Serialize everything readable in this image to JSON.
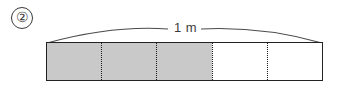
{
  "figure": {
    "item_number": "②",
    "measurement_label": "1 m"
  },
  "chart_data": {
    "type": "bar",
    "title": "",
    "subtitle": "",
    "xlabel": "",
    "ylabel": "",
    "annotations": [
      "1 m"
    ],
    "total_length_label": "1 m",
    "total_segments": 5,
    "shaded_segments": 3,
    "unshaded_segments": 2,
    "fraction_shaded": "3/5",
    "segments": [
      {
        "index": 1,
        "state": "shaded"
      },
      {
        "index": 2,
        "state": "shaded"
      },
      {
        "index": 3,
        "state": "shaded"
      },
      {
        "index": 4,
        "state": "unshaded"
      },
      {
        "index": 5,
        "state": "unshaded"
      }
    ],
    "colors": {
      "shaded_fill": "#c9c9c9",
      "unshaded_fill": "#ffffff",
      "outline": "#222222",
      "divider": "#1a1a1a"
    },
    "grid": false,
    "legend": "none"
  }
}
